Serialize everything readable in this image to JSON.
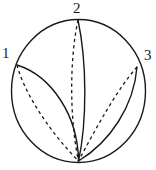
{
  "figure": {
    "kind": "disk-with-arcs-diagram",
    "width": 156,
    "height": 170,
    "background_color": "#ffffff",
    "stroke_color": "#1a1a1a",
    "solid_stroke_width": 1.4,
    "dashed_stroke_width": 1.3,
    "dash_pattern": "3.2 3.2"
  },
  "boundary_circle": {
    "name": "disk-boundary",
    "center_x": 78.5,
    "center_y": 91,
    "radius_x": 67,
    "radius_y": 71.5,
    "style": "solid"
  },
  "labels": [
    {
      "id": "1",
      "text": "1",
      "x": 2,
      "y": 46
    },
    {
      "id": "2",
      "text": "2",
      "x": 73,
      "y": 1
    },
    {
      "id": "3",
      "text": "3",
      "x": 144,
      "y": 48
    }
  ],
  "points": {
    "p1": {
      "label": "1",
      "x": 17,
      "y": 65
    },
    "p2": {
      "label": "2",
      "x": 78,
      "y": 20
    },
    "p3": {
      "label": "3",
      "x": 137,
      "y": 67
    },
    "apex": {
      "label": "",
      "x": 78.5,
      "y": 161
    }
  },
  "arcs": [
    {
      "name": "arc-1-solid",
      "from": "p1",
      "to": "apex",
      "style": "solid",
      "path": "M 17 65 C 52 76, 78 116, 78.5 161"
    },
    {
      "name": "arc-1-dashed",
      "from": "p1",
      "to": "apex",
      "style": "dashed",
      "path": "M 17 65 C 24 92, 48 130, 78.5 161"
    },
    {
      "name": "arc-2-solid",
      "from": "p2",
      "to": "apex",
      "style": "solid",
      "path": "M 78 20 C 87 62, 87 122, 78.5 161"
    },
    {
      "name": "arc-2-dashed",
      "from": "p2",
      "to": "apex",
      "style": "dashed",
      "path": "M 78 20 C 69 62, 70 122, 78.5 161"
    },
    {
      "name": "arc-3-solid",
      "from": "p3",
      "to": "apex",
      "style": "solid",
      "path": "M 137 67 C 134 106, 110 142, 78.5 161"
    },
    {
      "name": "arc-3-dashed",
      "from": "p3",
      "to": "apex",
      "style": "dashed",
      "path": "M 137 67 C 118 88, 96 128, 78.5 161"
    }
  ]
}
